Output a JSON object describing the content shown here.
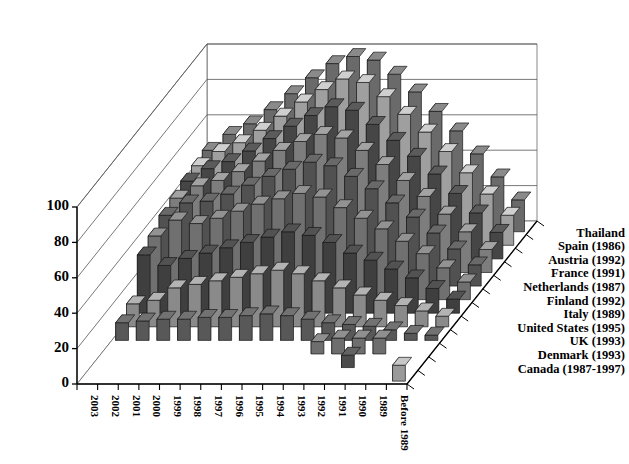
{
  "chart_data": {
    "type": "bar",
    "subtype": "3d-clustered-bar",
    "title": "",
    "xlabel": "",
    "ylabel": "",
    "zlabel": "",
    "ylim": [
      0,
      100
    ],
    "yticks": [
      0,
      20,
      40,
      60,
      80,
      100
    ],
    "grid": true,
    "legend_position": "right-depth-axis",
    "categories": [
      "2003",
      "2002",
      "2001",
      "2000",
      "1999",
      "1998",
      "1997",
      "1996",
      "1995",
      "1994",
      "1993",
      "1992",
      "1991",
      "1990",
      "1989",
      "Before 1989"
    ],
    "series": [
      {
        "name": "Canada (1987-1997)",
        "color": "#9a9a9a",
        "values": [
          0,
          0,
          0,
          0,
          0,
          0,
          0,
          0,
          0,
          0,
          0,
          0,
          0,
          0,
          0,
          9
        ]
      },
      {
        "name": "Denmark (1993)",
        "color": "#4c4c4c",
        "values": [
          0,
          0,
          0,
          0,
          0,
          0,
          0,
          0,
          0,
          0,
          0,
          0,
          7,
          0,
          0,
          0
        ]
      },
      {
        "name": "UK (1993)",
        "color": "#6e6e6e",
        "values": [
          0,
          0,
          0,
          0,
          0,
          0,
          0,
          0,
          0,
          0,
          7,
          9,
          9,
          9,
          0,
          0
        ]
      },
      {
        "name": "United States (1995)",
        "color": "#585858",
        "values": [
          10,
          11,
          12,
          12,
          13,
          13,
          14,
          15,
          14,
          12,
          10,
          9,
          8,
          6,
          4,
          3
        ]
      },
      {
        "name": "Italy (1989)",
        "color": "#8a8a8a",
        "values": [
          13,
          15,
          22,
          24,
          26,
          28,
          30,
          32,
          30,
          26,
          22,
          18,
          15,
          12,
          9,
          6
        ]
      },
      {
        "name": "Finland (1992)",
        "color": "#3f3f3f",
        "values": [
          33,
          27,
          31,
          34,
          37,
          40,
          43,
          46,
          44,
          40,
          34,
          30,
          25,
          20,
          14,
          8
        ]
      },
      {
        "name": "Netherlands (1987)",
        "color": "#707070",
        "values": [
          36,
          45,
          43,
          46,
          50,
          54,
          57,
          60,
          58,
          52,
          46,
          40,
          33,
          26,
          18,
          10
        ]
      },
      {
        "name": "France (1991)",
        "color": "#515151",
        "values": [
          40,
          47,
          48,
          52,
          57,
          62,
          66,
          70,
          68,
          62,
          55,
          47,
          39,
          30,
          21,
          12
        ]
      },
      {
        "name": "Austria (1992)",
        "color": "#7d7d7d",
        "values": [
          42,
          49,
          52,
          57,
          63,
          69,
          74,
          78,
          76,
          69,
          61,
          52,
          43,
          33,
          23,
          13
        ]
      },
      {
        "name": "Spain (1986)",
        "color": "#464646",
        "values": [
          44,
          51,
          55,
          61,
          68,
          75,
          81,
          86,
          84,
          76,
          67,
          58,
          48,
          37,
          26,
          15
        ]
      },
      {
        "name": "Thailand",
        "color": "#9f9f9f",
        "values": [
          45,
          53,
          58,
          65,
          73,
          81,
          88,
          94,
          92,
          84,
          74,
          64,
          53,
          41,
          29,
          17
        ]
      },
      {
        "name": "Thailand ",
        "color": "#6a6a6a",
        "values": [
          46,
          55,
          61,
          69,
          78,
          87,
          95,
          99,
          97,
          89,
          79,
          68,
          57,
          44,
          31,
          18
        ]
      }
    ],
    "legend_labels": [
      "Thailand",
      "Spain (1986)",
      "Austria (1992)",
      "France (1991)",
      "Netherlands (1987)",
      "Finland (1992)",
      "Italy (1989)",
      "United States (1995)",
      "UK (1993)",
      "Denmark (1993)",
      "Canada (1987-1997)"
    ]
  },
  "axes": {
    "y_tick_labels": [
      "0",
      "20",
      "40",
      "60",
      "80",
      "100"
    ],
    "x_tick_labels": [
      "2003",
      "2002",
      "2001",
      "2000",
      "1999",
      "1998",
      "1997",
      "1996",
      "1995",
      "1994",
      "1993",
      "1992",
      "1991",
      "1990",
      "1989",
      "Before 1989"
    ]
  },
  "style": {
    "bar_face": "#5a5a5a",
    "bar_top": "#b8b8b8",
    "bar_side": "#8f8f8f",
    "axis_color": "#000000",
    "grid_color": "#555555",
    "background": "#ffffff"
  }
}
